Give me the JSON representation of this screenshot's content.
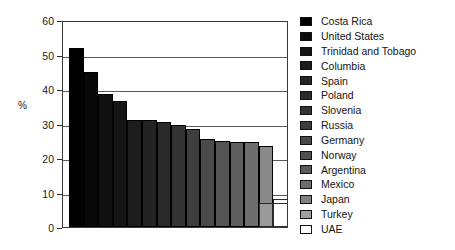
{
  "chart_data": {
    "type": "bar",
    "title": "",
    "subtitle": "",
    "xlabel": "",
    "ylabel": "%",
    "ylim": [
      0,
      60
    ],
    "yticks": [
      0,
      10,
      20,
      30,
      40,
      50,
      60
    ],
    "ytick_labels": [
      "0",
      "10",
      "20",
      "30",
      "40",
      "50",
      "60"
    ],
    "grid": "horizontal",
    "legend_position": "right",
    "categories": [
      "Costa Rica",
      "United States",
      "Trinidad and Tobago",
      "Columbia",
      "Spain",
      "Poland",
      "Slovenia",
      "Russia",
      "Germany",
      "Norway",
      "Argentina",
      "Mexico",
      "Japan",
      "Turkey",
      "UAE"
    ],
    "values": [
      52,
      45,
      38.5,
      36.5,
      31,
      31,
      30.5,
      29.5,
      28.5,
      25.5,
      25,
      24.5,
      24.5,
      23.5,
      8
    ],
    "series": [
      {
        "name": "%",
        "values": [
          52,
          45,
          38.5,
          36.5,
          31,
          31,
          30.5,
          29.5,
          28.5,
          25.5,
          25,
          24.5,
          24.5,
          23.5,
          8
        ]
      }
    ],
    "bar_colors": [
      "#000000",
      "#080808",
      "#101010",
      "#141414",
      "#1d1d1d",
      "#232323",
      "#292929",
      "#343434",
      "#3e3e3e",
      "#4a4a4a",
      "#555555",
      "#5f5f5f",
      "#6e6e6e",
      "#8a8a8a",
      "#ffffff"
    ],
    "bars": [
      {
        "label": "Costa Rica",
        "value": 52,
        "color": "#000000"
      },
      {
        "label": "United States",
        "value": 45,
        "color": "#080808"
      },
      {
        "label": "Trinidad and Tobago",
        "value": 38.5,
        "color": "#101010"
      },
      {
        "label": "Columbia",
        "value": 36.5,
        "color": "#141414"
      },
      {
        "label": "Spain",
        "value": 31,
        "color": "#1d1d1d"
      },
      {
        "label": "Poland",
        "value": 31,
        "color": "#232323"
      },
      {
        "label": "Slovenia",
        "value": 30.5,
        "color": "#292929"
      },
      {
        "label": "Russia",
        "value": 29.5,
        "color": "#343434"
      },
      {
        "label": "Germany",
        "value": 28.5,
        "color": "#3e3e3e"
      },
      {
        "label": "Norway",
        "value": 25.5,
        "color": "#4a4a4a"
      },
      {
        "label": "Argentina",
        "value": 25,
        "color": "#555555"
      },
      {
        "label": "Mexico",
        "value": 24.5,
        "color": "#5f5f5f"
      },
      {
        "label": "Japan",
        "value": 24.5,
        "color": "#6e6e6e"
      },
      {
        "label": "Turkey",
        "value": 23.5,
        "color": "#8a8a8a"
      },
      {
        "label": "UAE",
        "value": 8,
        "color": "#ffffff"
      }
    ],
    "extra_bars": [
      {
        "label": "Turkey-tail",
        "value": 7,
        "color": "#9a9a9a"
      },
      {
        "label": "UAE-tail",
        "value": 7,
        "color": "#ffffff"
      }
    ]
  },
  "axis": {
    "y_title": "%"
  },
  "legend": {
    "items": [
      {
        "label": "Costa Rica",
        "color": "#000000"
      },
      {
        "label": "United States",
        "color": "#0c0c0c"
      },
      {
        "label": "Trinidad and Tobago",
        "color": "#141414"
      },
      {
        "label": "Columbia",
        "color": "#1c1c1c"
      },
      {
        "label": "Spain",
        "color": "#242424"
      },
      {
        "label": "Poland",
        "color": "#2b2b2b"
      },
      {
        "label": "Slovenia",
        "color": "#333333"
      },
      {
        "label": "Russia",
        "color": "#3d3d3d"
      },
      {
        "label": "Germany",
        "color": "#474747"
      },
      {
        "label": "Norway",
        "color": "#505050"
      },
      {
        "label": "Argentina",
        "color": "#5a5a5a"
      },
      {
        "label": "Mexico",
        "color": "#6d6d6d"
      },
      {
        "label": "Japan",
        "color": "#7f7f7f"
      },
      {
        "label": "Turkey",
        "color": "#a0a0a0"
      },
      {
        "label": "UAE",
        "color": "#ffffff"
      }
    ]
  }
}
